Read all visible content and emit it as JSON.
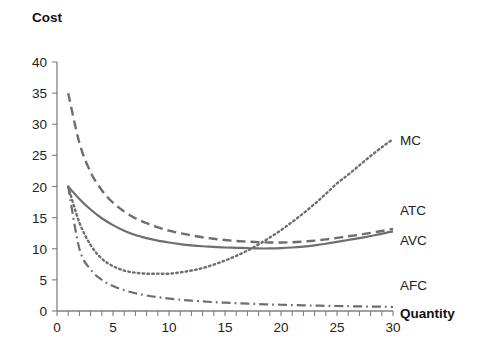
{
  "chart_data": {
    "type": "line",
    "title": "",
    "ylabel": "Cost",
    "xlabel": "Quantity",
    "xlim": [
      0,
      30
    ],
    "ylim": [
      0,
      40
    ],
    "grid": false,
    "legend_position": "right-inline",
    "xticks": [
      0,
      1,
      2,
      3,
      4,
      5,
      6,
      7,
      8,
      9,
      10,
      11,
      12,
      13,
      14,
      15,
      16,
      17,
      18,
      19,
      20,
      21,
      22,
      23,
      24,
      25,
      26,
      27,
      28,
      29,
      30
    ],
    "xtick_labels": [
      "0",
      "5",
      "10",
      "15",
      "20",
      "25",
      "30"
    ],
    "xtick_label_values": [
      0,
      5,
      10,
      15,
      20,
      25,
      30
    ],
    "yticks": [
      0,
      5,
      10,
      15,
      20,
      25,
      30,
      35,
      40
    ],
    "ytick_labels": [
      "0",
      "5",
      "10",
      "15",
      "20",
      "25",
      "30",
      "35",
      "40"
    ],
    "x": [
      1,
      2,
      3,
      4,
      5,
      6,
      7,
      8,
      9,
      10,
      11,
      12,
      13,
      14,
      15,
      16,
      17,
      18,
      19,
      20,
      21,
      22,
      23,
      24,
      25,
      26,
      27,
      28,
      29,
      30
    ],
    "series": [
      {
        "name": "MC",
        "label": "MC",
        "style": "dotted",
        "color": "#6e6e6e",
        "values": [
          20.0,
          14.2,
          10.6,
          8.4,
          7.2,
          6.5,
          6.15,
          6.0,
          6.0,
          6.0,
          6.2,
          6.5,
          6.9,
          7.45,
          8.1,
          8.85,
          9.7,
          10.7,
          11.8,
          13.0,
          14.3,
          15.7,
          17.2,
          18.8,
          20.5,
          21.9,
          23.4,
          24.9,
          26.3,
          27.6
        ]
      },
      {
        "name": "ATC",
        "label": "ATC",
        "style": "dashed",
        "color": "#6e6e6e",
        "values": [
          35.0,
          27.0,
          22.3,
          19.4,
          17.4,
          16.0,
          14.9,
          14.1,
          13.45,
          12.9,
          12.5,
          12.15,
          11.85,
          11.6,
          11.4,
          11.25,
          11.15,
          11.05,
          11.0,
          11.0,
          11.05,
          11.15,
          11.3,
          11.5,
          11.75,
          12.0,
          12.25,
          12.55,
          12.85,
          13.2
        ]
      },
      {
        "name": "AVC",
        "label": "AVC",
        "style": "solid",
        "color": "#6e6e6e",
        "values": [
          20.0,
          18.0,
          16.3,
          14.9,
          13.8,
          12.9,
          12.2,
          11.7,
          11.3,
          11.0,
          10.75,
          10.55,
          10.4,
          10.3,
          10.2,
          10.15,
          10.1,
          10.05,
          10.05,
          10.1,
          10.2,
          10.35,
          10.55,
          10.8,
          11.1,
          11.4,
          11.7,
          12.05,
          12.4,
          12.8
        ]
      },
      {
        "name": "AFC",
        "label": "AFC",
        "style": "dash-dot",
        "color": "#6e6e6e",
        "values": [
          20.0,
          10.0,
          6.67,
          5.0,
          4.0,
          3.33,
          2.86,
          2.5,
          2.22,
          2.0,
          1.82,
          1.67,
          1.54,
          1.43,
          1.33,
          1.25,
          1.18,
          1.11,
          1.05,
          1.0,
          0.95,
          0.91,
          0.87,
          0.83,
          0.8,
          0.77,
          0.74,
          0.71,
          0.69,
          0.67
        ]
      }
    ]
  },
  "labels": {
    "cost_title": "Cost",
    "quantity_title": "Quantity",
    "mc": "MC",
    "atc": "ATC",
    "avc": "AVC",
    "afc": "AFC"
  },
  "colors": {
    "curve": "#6e6e6e",
    "axis": "#808080",
    "text": "#222222",
    "background": "#ffffff"
  }
}
